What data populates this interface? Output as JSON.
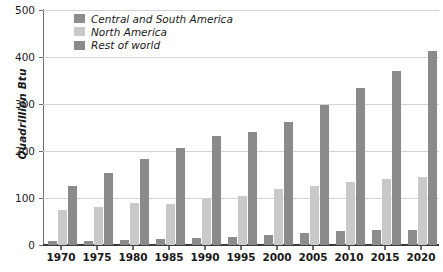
{
  "chart_data": {
    "type": "bar",
    "title": "",
    "xlabel": "",
    "ylabel": "Quadrillion Btu",
    "ylim": [
      0,
      500
    ],
    "ytick_values": [
      0,
      100,
      200,
      300,
      400,
      500
    ],
    "ytick_labels": [
      "0",
      "100",
      "200",
      "300",
      "400",
      "500"
    ],
    "grid": true,
    "legend_position": "top-left-inside",
    "categories": [
      "1970",
      "1975",
      "1980",
      "1985",
      "1990",
      "1995",
      "2000",
      "2005",
      "2010",
      "2015",
      "2020"
    ],
    "series": [
      {
        "name": "Central and South America",
        "color": "#8c8c8c",
        "values": [
          8,
          9,
          11,
          13,
          15,
          17,
          21,
          26,
          29,
          31,
          33
        ]
      },
      {
        "name": "North America",
        "color": "#c9c9c9",
        "values": [
          75,
          80,
          89,
          88,
          97,
          105,
          120,
          126,
          134,
          140,
          145
        ]
      },
      {
        "name": "Rest of world",
        "color": "#8a8a8a",
        "values": [
          125,
          154,
          183,
          207,
          233,
          241,
          261,
          298,
          334,
          371,
          412
        ]
      }
    ]
  },
  "legend": {
    "items": [
      {
        "label": "Central and South America",
        "key": "csa"
      },
      {
        "label": "North America",
        "key": "na"
      },
      {
        "label": "Rest of world",
        "key": "row"
      }
    ]
  }
}
